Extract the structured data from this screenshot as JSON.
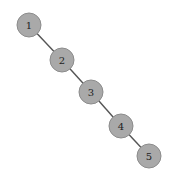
{
  "diagram": {
    "type": "graph",
    "layout": "diagonal-chain",
    "nodes": [
      {
        "id": "1",
        "label": "1",
        "x": 29,
        "y": 25
      },
      {
        "id": "2",
        "label": "2",
        "x": 62,
        "y": 60
      },
      {
        "id": "3",
        "label": "3",
        "x": 91,
        "y": 92
      },
      {
        "id": "4",
        "label": "4",
        "x": 121,
        "y": 126
      },
      {
        "id": "5",
        "label": "5",
        "x": 149,
        "y": 156
      }
    ],
    "edges": [
      {
        "from": "1",
        "to": "2"
      },
      {
        "from": "2",
        "to": "3"
      },
      {
        "from": "3",
        "to": "4"
      },
      {
        "from": "4",
        "to": "5"
      }
    ],
    "node_radius": 12,
    "colors": {
      "node_fill": "#a9a9a9",
      "node_stroke": "#8c8c8c",
      "edge": "#555555",
      "label": "#222222",
      "background": "#ffffff"
    }
  }
}
